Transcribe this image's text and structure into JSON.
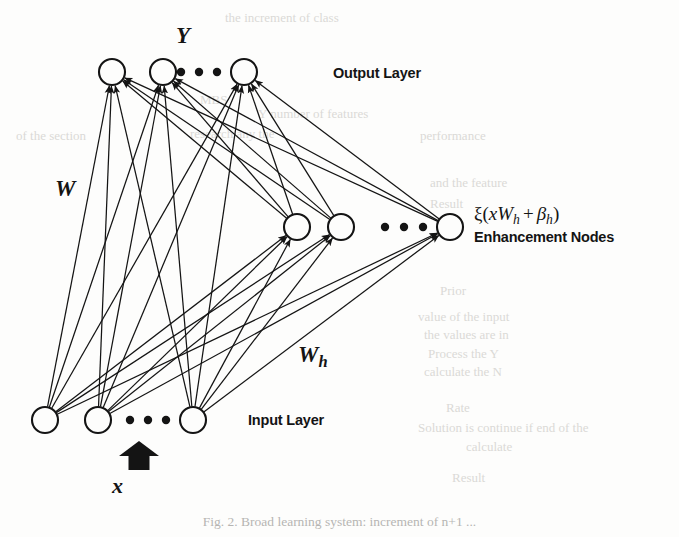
{
  "figure": {
    "caption": "Fig. 2.  Broad learning system: increment of n+1 ...",
    "background_color": "#fdfdfc",
    "ink_color": "#141414"
  },
  "labels": {
    "output_variable": "Y",
    "weight_output": "W",
    "weight_hidden_base": "W",
    "weight_hidden_sub": "h",
    "input_variable": "x",
    "output_layer": "Output Layer",
    "input_layer": "Input Layer",
    "enhancement_formula": {
      "xi": "ξ",
      "open": "(",
      "x": "x",
      "W": "W",
      "W_sub": "h",
      "plus": "+",
      "beta": "β",
      "beta_sub": "h",
      "close": ")",
      "full": "ξ(xWₕ + βₕ)"
    },
    "enhancement_nodes": "Enhancement Nodes",
    "ellipsis": "• • •"
  },
  "ghost_text": [
    {
      "text": "the  increment  of  class",
      "x": 225,
      "y": 10
    },
    {
      "text": "Y number of features",
      "x": 258,
      "y": 106
    },
    {
      "text": "performance",
      "x": 420,
      "y": 128
    },
    {
      "text": "and  the  feature",
      "x": 430,
      "y": 175
    },
    {
      "text": "Result",
      "x": 430,
      "y": 196
    },
    {
      "text": "Prior",
      "x": 440,
      "y": 283
    },
    {
      "text": "value  of  the  input",
      "x": 418,
      "y": 309
    },
    {
      "text": "the  values  are  in",
      "x": 424,
      "y": 327
    },
    {
      "text": "Process  the  Y",
      "x": 428,
      "y": 346
    },
    {
      "text": "calculate  the  N",
      "x": 424,
      "y": 364
    },
    {
      "text": "Rate",
      "x": 446,
      "y": 400
    },
    {
      "text": "Solution  is  continue  if  end  of  the",
      "x": 418,
      "y": 420
    },
    {
      "text": "calculate",
      "x": 466,
      "y": 439
    },
    {
      "text": "Result",
      "x": 452,
      "y": 470
    },
    {
      "text": "MBS",
      "x": 200,
      "y": 92
    },
    {
      "text": "research  any  the",
      "x": 190,
      "y": 126
    },
    {
      "text": "of  the  section",
      "x": 16,
      "y": 128
    }
  ],
  "chart_data": {
    "type": "diagram",
    "diagram_kind": "neural-network",
    "node_radius": 13,
    "dot_radius": 4.2,
    "layers": [
      {
        "id": "output",
        "name": "Output Layer",
        "node_count_shown": 3,
        "ellipsis_between_index": 1,
        "nodes": [
          {
            "id": "o1",
            "cx": 112,
            "cy": 72
          },
          {
            "id": "o2",
            "cx": 163,
            "cy": 72
          },
          {
            "id": "o3",
            "cx": 244,
            "cy": 72
          }
        ],
        "ellipsis_dots": [
          {
            "cx": 181,
            "cy": 72
          },
          {
            "cx": 199,
            "cy": 72
          },
          {
            "cx": 217,
            "cy": 72
          }
        ]
      },
      {
        "id": "enhancement",
        "name": "Enhancement Nodes",
        "node_count_shown": 3,
        "ellipsis_between_index": 1,
        "nodes": [
          {
            "id": "e1",
            "cx": 297,
            "cy": 227
          },
          {
            "id": "e2",
            "cx": 341,
            "cy": 227
          },
          {
            "id": "e3",
            "cx": 450,
            "cy": 227
          }
        ],
        "ellipsis_dots": [
          {
            "cx": 385,
            "cy": 227
          },
          {
            "cx": 404,
            "cy": 227
          },
          {
            "cx": 423,
            "cy": 227
          }
        ]
      },
      {
        "id": "input",
        "name": "Input Layer",
        "node_count_shown": 3,
        "ellipsis_between_index": 1,
        "nodes": [
          {
            "id": "i1",
            "cx": 45,
            "cy": 420
          },
          {
            "id": "i2",
            "cx": 98,
            "cy": 420
          },
          {
            "id": "i3",
            "cx": 193,
            "cy": 420
          }
        ],
        "ellipsis_dots": [
          {
            "cx": 130,
            "cy": 420
          },
          {
            "cx": 148,
            "cy": 420
          },
          {
            "cx": 166,
            "cy": 420
          }
        ]
      }
    ],
    "edges": [
      {
        "from": "i1",
        "to": "o1"
      },
      {
        "from": "i1",
        "to": "o2"
      },
      {
        "from": "i1",
        "to": "o3"
      },
      {
        "from": "i2",
        "to": "o1"
      },
      {
        "from": "i2",
        "to": "o2"
      },
      {
        "from": "i2",
        "to": "o3"
      },
      {
        "from": "i3",
        "to": "o1"
      },
      {
        "from": "i3",
        "to": "o2"
      },
      {
        "from": "i3",
        "to": "o3"
      },
      {
        "from": "i1",
        "to": "e1"
      },
      {
        "from": "i1",
        "to": "e2"
      },
      {
        "from": "i1",
        "to": "e3"
      },
      {
        "from": "i2",
        "to": "e1"
      },
      {
        "from": "i2",
        "to": "e2"
      },
      {
        "from": "i2",
        "to": "e3"
      },
      {
        "from": "i3",
        "to": "e1"
      },
      {
        "from": "i3",
        "to": "e2"
      },
      {
        "from": "i3",
        "to": "e3"
      },
      {
        "from": "e1",
        "to": "o1"
      },
      {
        "from": "e1",
        "to": "o2"
      },
      {
        "from": "e1",
        "to": "o3"
      },
      {
        "from": "e2",
        "to": "o1"
      },
      {
        "from": "e2",
        "to": "o2"
      },
      {
        "from": "e2",
        "to": "o3"
      },
      {
        "from": "e3",
        "to": "o1"
      },
      {
        "from": "e3",
        "to": "o2"
      },
      {
        "from": "e3",
        "to": "o3"
      }
    ],
    "input_arrow": {
      "x": 139,
      "y_from": 470,
      "y_to": 441,
      "label": "x"
    },
    "edge_label_W": {
      "text": "W",
      "x": 60,
      "y": 192
    },
    "edge_label_Wh": {
      "text": "Wh",
      "x": 305,
      "y": 360
    }
  }
}
